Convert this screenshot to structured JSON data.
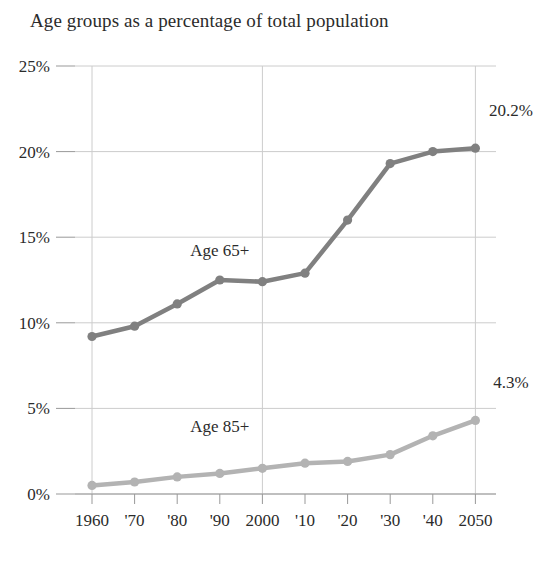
{
  "chart_data": {
    "type": "line",
    "title": "Age groups as a percentage of total population",
    "xlabel": "",
    "ylabel": "",
    "categories": [
      "1960",
      "'70",
      "'80",
      "'90",
      "2000",
      "'10",
      "'20",
      "'30",
      "'40",
      "2050"
    ],
    "x_tick_labels": [
      "1960",
      "'70",
      "'80",
      "'90",
      "2000",
      "'10",
      "'20",
      "'30",
      "'40",
      "2050"
    ],
    "y_tick_labels": [
      "0%",
      "5%",
      "10%",
      "15%",
      "20%",
      "25%"
    ],
    "y_tick_values": [
      0,
      5,
      10,
      15,
      20,
      25
    ],
    "ylim": [
      0,
      25
    ],
    "grid": true,
    "legend_position": "inline-annotation",
    "series": [
      {
        "name": "Age 65+",
        "label": "Age 65+",
        "color": "#808080",
        "end_label": "20.2%",
        "values": [
          9.2,
          9.8,
          11.1,
          12.5,
          12.4,
          12.9,
          16.0,
          19.3,
          20.0,
          20.2
        ]
      },
      {
        "name": "Age 85+",
        "label": "Age 85+",
        "color": "#b3b3b3",
        "end_label": "4.3%",
        "values": [
          0.5,
          0.7,
          1.0,
          1.2,
          1.5,
          1.8,
          1.9,
          2.3,
          3.4,
          4.3
        ]
      }
    ],
    "annotations": [
      {
        "text": "Age 65+",
        "x_category": "'90",
        "y_value": 13.9
      },
      {
        "text": "Age 85+",
        "x_category": "'90",
        "y_value": 3.6
      },
      {
        "text": "20.2%",
        "x_category": "2050",
        "y_value": 22.1
      },
      {
        "text": "4.3%",
        "x_category": "2050",
        "y_value": 6.2
      }
    ],
    "colors": {
      "grid": "#cccccc",
      "axis": "#999999",
      "text": "#2b2b2b",
      "series_65plus": "#808080",
      "series_85plus": "#b3b3b3",
      "background": "#ffffff"
    }
  }
}
